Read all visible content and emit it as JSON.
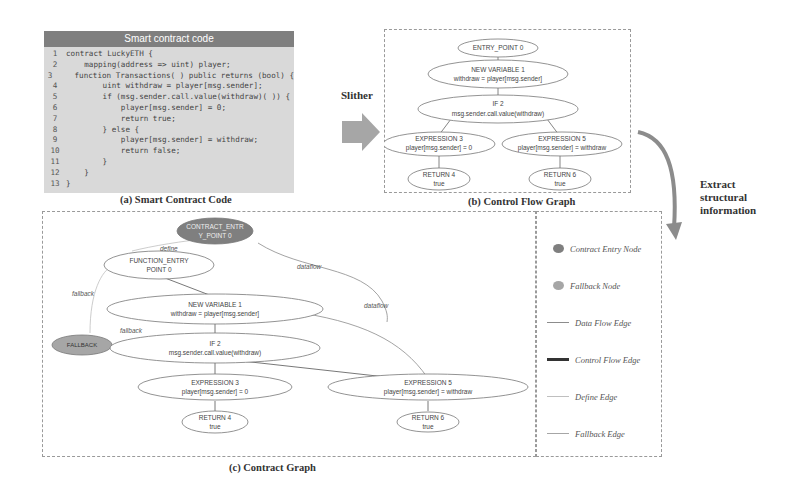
{
  "code_panel": {
    "header": "Smart contract code",
    "lines": [
      {
        "n": "1",
        "text": "contract LuckyETH {"
      },
      {
        "n": "2",
        "text": "    mapping(address => uint) player;"
      },
      {
        "n": "3",
        "text": "    function Transactions( ) public returns (bool) {"
      },
      {
        "n": "4",
        "text": "        uint withdraw = player[msg.sender];"
      },
      {
        "n": "5",
        "text": "        if (msg.sender.call.value(withdraw)( )) {"
      },
      {
        "n": "6",
        "text": "            player[msg.sender] = 0;"
      },
      {
        "n": "7",
        "text": "            return true;"
      },
      {
        "n": "8",
        "text": "        } else {"
      },
      {
        "n": "9",
        "text": "            player[msg.sender] = withdraw;"
      },
      {
        "n": "10",
        "text": "            return false;"
      },
      {
        "n": "11",
        "text": "        }"
      },
      {
        "n": "12",
        "text": "    }"
      },
      {
        "n": "13",
        "text": "}"
      }
    ],
    "caption": "(a) Smart Contract Code"
  },
  "slither_arrow": {
    "label": "Slither",
    "color": "#a6a6a6"
  },
  "cfg": {
    "caption": "(b) Control Flow Graph",
    "nodes": {
      "entry": {
        "l1": "ENTRY_POINT 0"
      },
      "newvar": {
        "l1": "NEW VARIABLE 1",
        "l2": "withdraw = player[msg.sender]"
      },
      "if2": {
        "l1": "IF 2",
        "l2": "msg.sender.call.value(withdraw)"
      },
      "expr3": {
        "l1": "EXPRESSION 3",
        "l2": "player[msg.sender] = 0"
      },
      "expr5": {
        "l1": "EXPRESSION 5",
        "l2": "player[msg.sender] = withdraw"
      },
      "ret4": {
        "l1": "RETURN 4",
        "l2": "true"
      },
      "ret6": {
        "l1": "RETURN 6",
        "l2": "true"
      }
    }
  },
  "extract": {
    "label_lines": [
      "Extract",
      "structural",
      "information"
    ]
  },
  "contract_graph": {
    "caption": "(c) Contract Graph",
    "nodes": {
      "contract_entry": {
        "l1": "CONTRACT_ENTR",
        "l2": "Y_POINT 0"
      },
      "fallback": {
        "l1": "FALLBACK"
      },
      "func_entry": {
        "l1": "FUNCTION_ENTRY",
        "l2": "POINT 0"
      },
      "newvar": {
        "l1": "NEW VARIABLE 1",
        "l2": "withdraw = player[msg.sender]"
      },
      "if2": {
        "l1": "IF 2",
        "l2": "msg.sender.call.value(withdraw)"
      },
      "expr3": {
        "l1": "EXPRESSION 3",
        "l2": "player[msg.sender] = 0"
      },
      "expr5": {
        "l1": "EXPRESSION 5",
        "l2": "player[msg.sender] = withdraw"
      },
      "ret4": {
        "l1": "RETURN 4",
        "l2": "true"
      },
      "ret6": {
        "l1": "RETURN 6",
        "l2": "true"
      }
    },
    "edge_labels": {
      "define": "define",
      "fallback1": "fallback",
      "fallback2": "fallback",
      "dataflow1": "dataflow",
      "dataflow2": "dataflow"
    }
  },
  "legend": {
    "items": [
      {
        "label": "Contract Entry Node",
        "kind": "node",
        "color": "#7f7f7f"
      },
      {
        "label": "Fallback Node",
        "kind": "node",
        "color": "#a6a6a6"
      },
      {
        "label": "Data Flow Edge",
        "kind": "edge",
        "color": "#8c8c8c"
      },
      {
        "label": "Control Flow Edge",
        "kind": "edge",
        "color": "#333333"
      },
      {
        "label": "Define Edge",
        "kind": "edge",
        "color": "#bfbfbf"
      },
      {
        "label": "Fallback Edge",
        "kind": "edge",
        "color": "#a6a6a6"
      }
    ]
  }
}
